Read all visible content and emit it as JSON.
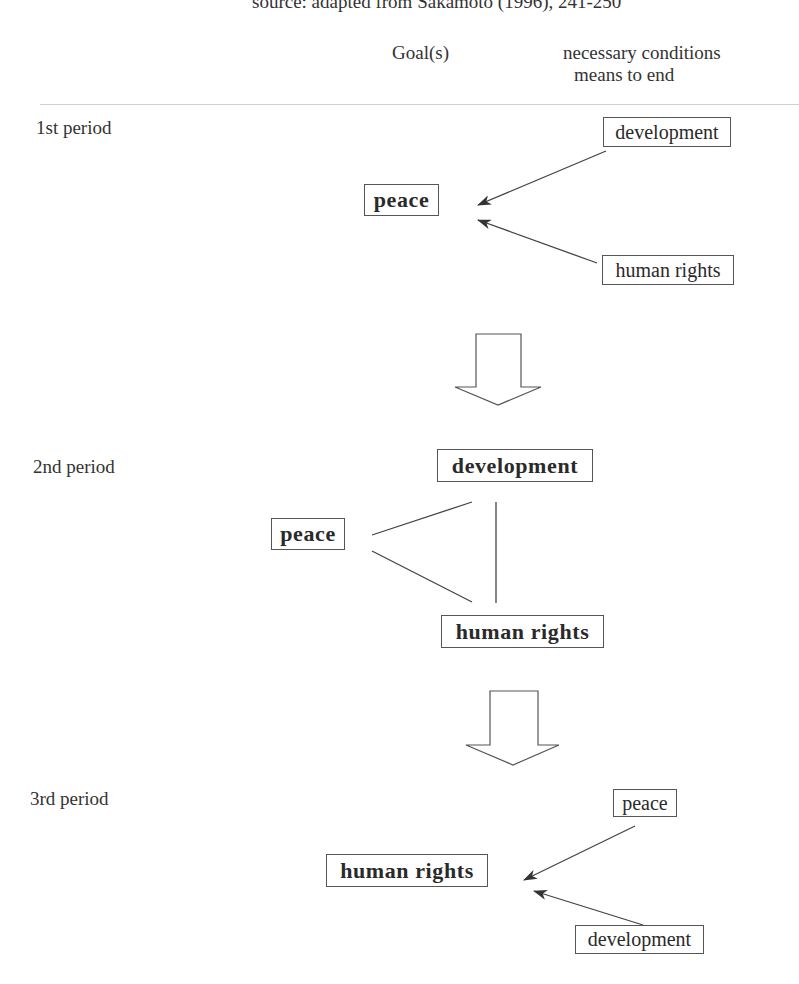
{
  "source_note": "source: adapted from Sakamoto (1996), 241-250",
  "header": {
    "goal_column": "Goal(s)",
    "means_column_line1": "necessary conditions",
    "means_column_line2": "means to end"
  },
  "periods": [
    {
      "label": "1st period",
      "goal": "peace",
      "conditions": [
        "development",
        "human rights"
      ],
      "relation": "conditions point to goal"
    },
    {
      "label": "2nd period",
      "nodes": [
        "development",
        "peace",
        "human rights"
      ],
      "relation": "mutually linked triangle"
    },
    {
      "label": "3rd period",
      "goal": "human rights",
      "conditions": [
        "peace",
        "development"
      ],
      "relation": "conditions point to goal"
    }
  ],
  "transition_arrows": [
    "period1-to-period2",
    "period2-to-period3"
  ],
  "colors": {
    "line": "#444444",
    "box_border": "#555555",
    "text": "#2a2a2a",
    "separator": "#cfcfcf"
  }
}
